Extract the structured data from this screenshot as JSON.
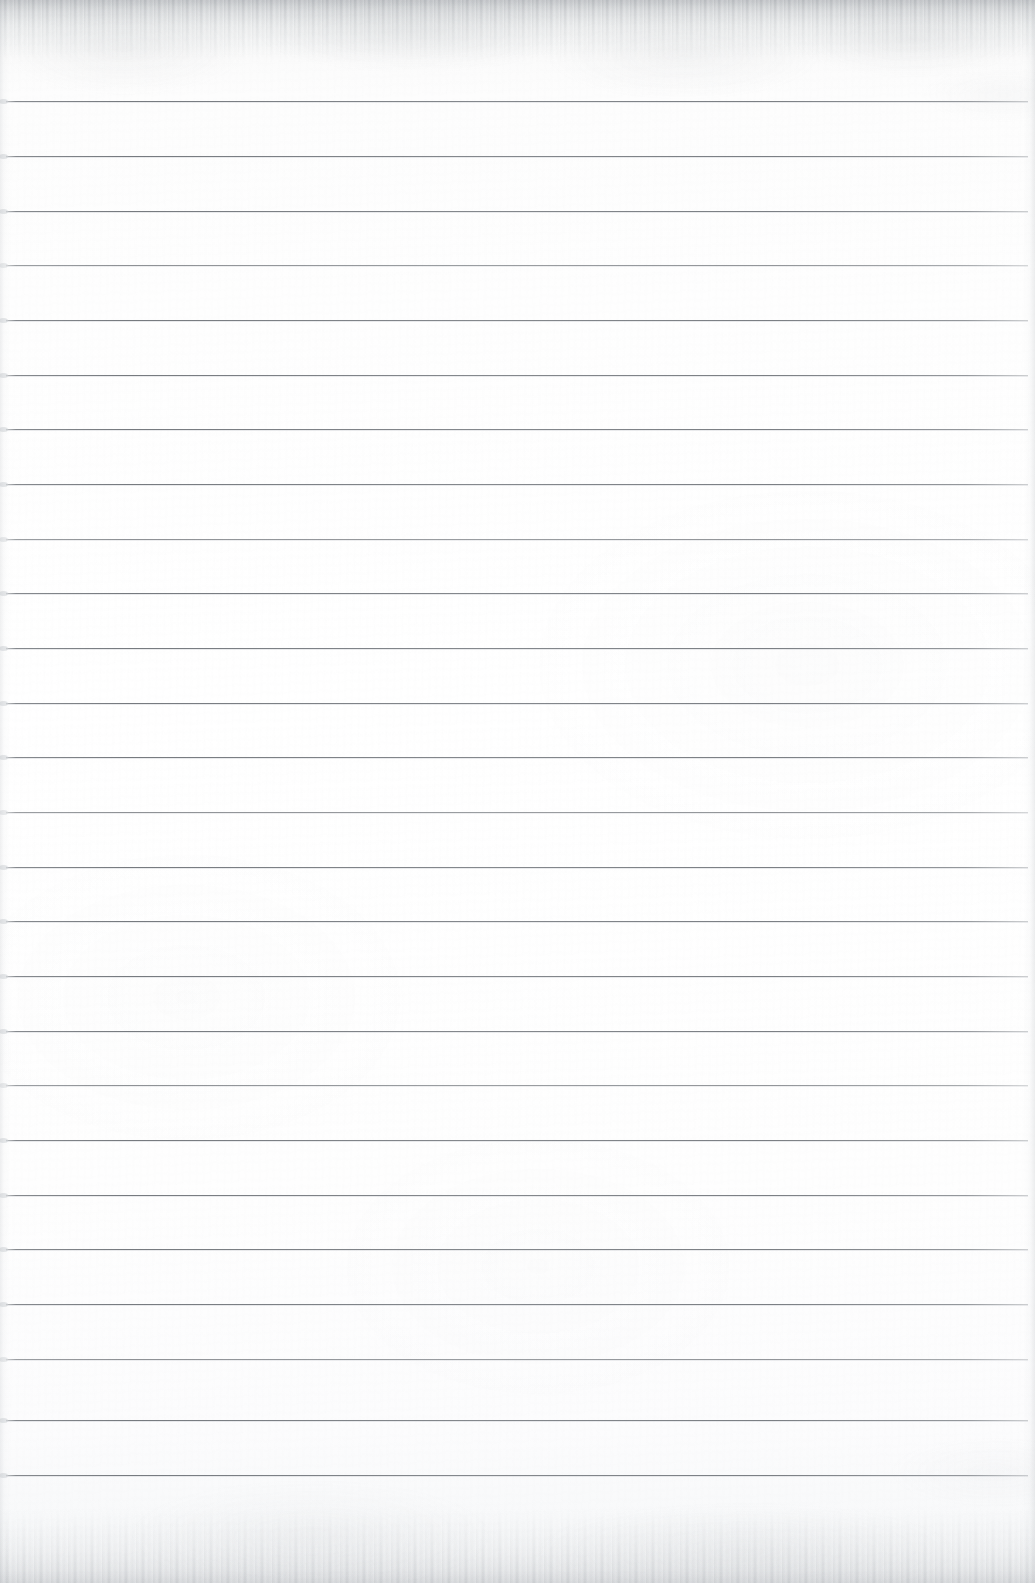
{
  "document": {
    "kind": "scanned-ruled-notebook-paper",
    "title": "Blank lined paper scan",
    "page_width": 1035,
    "page_height": 1583,
    "orientation": "portrait",
    "text_content": "",
    "handwriting": "",
    "printed_text": "",
    "notes": "No text, headings, numbers, captions or marks are visible on this page."
  },
  "paper": {
    "base_color": "#fdfdfd",
    "tint_top": "#f2f3f4",
    "tint_bottom": "#f3f4f5",
    "surface": "smooth white writing paper",
    "has_margin_rule": false,
    "has_holes": false,
    "has_header": false,
    "has_footer": false,
    "page_number": ""
  },
  "rules": {
    "label": "horizontal ruled lines",
    "color": "#7c8085",
    "thickness_px": 1,
    "count": 26,
    "first_line_y": 101,
    "spacing_px": 54.7,
    "x_start": 6,
    "x_end": 1028,
    "lines_y": [
      101,
      156,
      211,
      265,
      320,
      375,
      429,
      484,
      539,
      593,
      648,
      703,
      757,
      812,
      867,
      921,
      976,
      1031,
      1085,
      1140,
      1195,
      1249,
      1304,
      1359,
      1420,
      1475
    ]
  },
  "scan": {
    "edge_top_label": "feathered scan edge",
    "edge_bottom_label": "feathered scan edge",
    "grain_label": "paper grain texture",
    "shadow_left_label": "left edge shading",
    "shadow_right_label": "right edge shading"
  }
}
